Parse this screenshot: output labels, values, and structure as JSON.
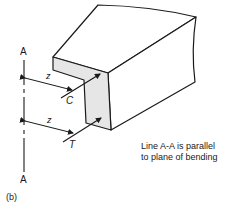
{
  "figure": {
    "label": "(b)",
    "axis_line": {
      "top_label": "A",
      "bottom_label": "A"
    },
    "dimensions": [
      {
        "label": "z",
        "target": "C"
      },
      {
        "label": "z",
        "target": "T"
      }
    ],
    "forces": {
      "compression_label": "C",
      "tension_label": "T"
    },
    "note": {
      "line1": "Line A-A is parallel",
      "line2": "to plane of bending"
    },
    "colors": {
      "stroke": "#1a1a1a",
      "section_fill": "#e6e6e6",
      "background": "#ffffff"
    }
  }
}
